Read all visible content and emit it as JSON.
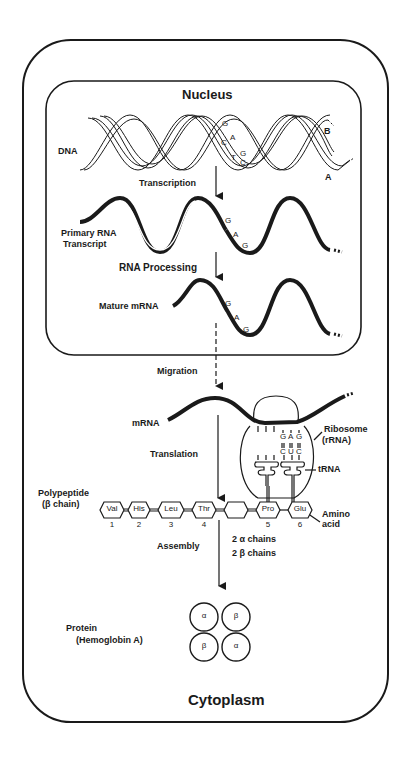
{
  "diagram": {
    "type": "flow",
    "compartments": {
      "cell": "Cytoplasm",
      "nucleus": "Nucleus"
    },
    "molecules": {
      "dna": {
        "label": "DNA",
        "strand_a": "A",
        "strand_b": "B",
        "bases_strand_b": [
          "G",
          "A",
          "G"
        ],
        "bases_strand_a": [
          "C",
          "T",
          "C"
        ]
      },
      "primary_rna": {
        "label_line1": "Primary RNA",
        "label_line2": "Transcript",
        "bases": [
          "G",
          "A",
          "G"
        ]
      },
      "mature_mrna": {
        "label": "Mature mRNA",
        "bases": [
          "G",
          "A",
          "G"
        ]
      },
      "cytoplasm_mrna": {
        "label": "mRNA"
      },
      "ribosome": {
        "label_line1": "Ribosome",
        "label_line2": "(rRNA)",
        "codon": [
          "G",
          "A",
          "G"
        ],
        "anticodon": [
          "C",
          "U",
          "C"
        ]
      },
      "trna": {
        "label": "tRNA"
      },
      "polypeptide": {
        "label_line1": "Polypeptide",
        "label_line2": "(β chain)",
        "amino_acids": [
          {
            "name": "Val",
            "index": "1"
          },
          {
            "name": "His",
            "index": "2"
          },
          {
            "name": "Leu",
            "index": "3"
          },
          {
            "name": "Thr",
            "index": "4"
          },
          {
            "name": "Pro",
            "index": "5"
          },
          {
            "name": "Glu",
            "index": "6"
          }
        ],
        "amino_acid_label_line1": "Amino",
        "amino_acid_label_line2": "acid"
      },
      "protein": {
        "label_line1": "Protein",
        "label_line2": "(Hemoglobin A)",
        "subunits": [
          "α",
          "β",
          "β",
          "α"
        ]
      }
    },
    "steps": {
      "transcription": "Transcription",
      "rna_processing": "RNA Processing",
      "migration": "Migration",
      "translation": "Translation",
      "assembly": "Assembly",
      "assembly_note_line1": "2  α  chains",
      "assembly_note_line2": "2  β  chains"
    }
  }
}
